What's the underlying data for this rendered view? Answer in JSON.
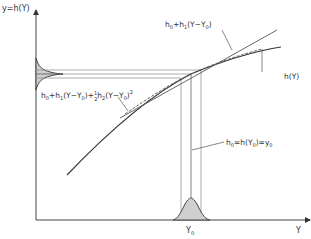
{
  "figure": {
    "y_axis_label": "y=h(Y)",
    "x_axis_label": "Y",
    "x_tick_label": "Y",
    "x_tick_sub": "0",
    "labels": {
      "tangent_main": "h",
      "tangent_sub0": "0",
      "tangent_rest": "+h",
      "tangent_sub1": "1",
      "tangent_paren": "(Y−Y",
      "tangent_sub2": "0",
      "tangent_close": ")",
      "quad_h": "h",
      "quad_sub0": "0",
      "quad_p1": "+h",
      "quad_sub1": "1",
      "quad_p2": "(Y−Y",
      "quad_sub2": "0",
      "quad_p3": ")+",
      "quad_half_num": "1",
      "quad_half_den": "2",
      "quad_p4": "h",
      "quad_sub3": "2",
      "quad_p5": "(Y−Y",
      "quad_sub4": "0",
      "quad_p6": ")",
      "quad_sup": "2",
      "curve_label": "h(Y)",
      "eq_h": "h",
      "eq_sub0": "0",
      "eq_p1": "=h(Y",
      "eq_sub1": "0",
      "eq_p2": ")=y",
      "eq_sub2": "0"
    },
    "colors": {
      "line": "#333333",
      "thin": "#777777",
      "fill": "#cfcfcf"
    }
  }
}
